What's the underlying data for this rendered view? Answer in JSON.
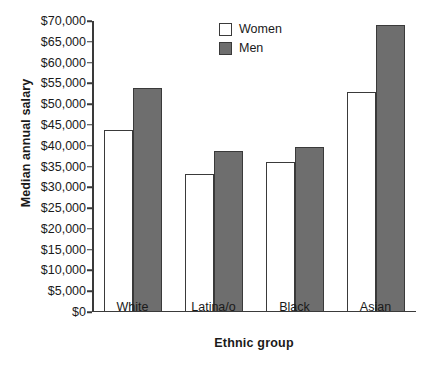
{
  "chart_data": {
    "type": "bar",
    "title": "",
    "xlabel": "Ethnic group",
    "ylabel": "Median annual salary",
    "categories": [
      "White",
      "Latina/o",
      "Black",
      "Asian"
    ],
    "series": [
      {
        "name": "Women",
        "values": [
          43800,
          33200,
          36200,
          53000
        ],
        "color": "#ffffff"
      },
      {
        "name": "Men",
        "values": [
          53800,
          38800,
          39800,
          69000
        ],
        "color": "#6e6e6e"
      }
    ],
    "ylim": [
      0,
      70000
    ],
    "ytick_values": [
      0,
      5000,
      10000,
      15000,
      20000,
      25000,
      30000,
      35000,
      40000,
      45000,
      50000,
      55000,
      60000,
      65000,
      70000
    ],
    "ytick_labels": [
      "$0",
      "$5,000",
      "$10,000",
      "$15,000",
      "$20,000",
      "$25,000",
      "$30,000",
      "$35,000",
      "$40,000",
      "$45,000",
      "$50,000",
      "$55,000",
      "$60,000",
      "$65,000",
      "$70,000"
    ],
    "grid": false,
    "legend_position": "top-center",
    "legend_entries": [
      "Women",
      "Men"
    ],
    "axis_color": "#3a3a3a",
    "background_color": "#ffffff"
  }
}
